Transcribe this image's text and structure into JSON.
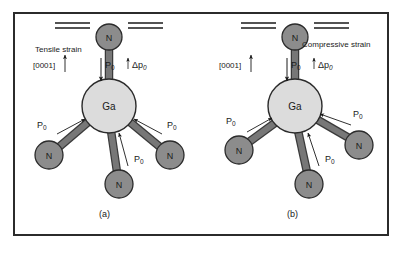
{
  "figure": {
    "panels": [
      {
        "id": "a",
        "caption": "(a)",
        "strain_label": "Tensile strain",
        "direction_label": "[0001]",
        "center_atom": "Ga",
        "ligand_atoms": [
          "N",
          "N",
          "N",
          "N"
        ],
        "axial_polarization_label": "P",
        "axial_polarization_sub": "0",
        "delta_label": "Δp",
        "delta_sub": "0",
        "bond_polarization_labels": [
          "P",
          "P",
          "P"
        ],
        "bond_polarization_sub": "0"
      },
      {
        "id": "b",
        "caption": "(b)",
        "strain_label": "Compressive strain",
        "direction_label": "[0001]",
        "center_atom": "Ga",
        "ligand_atoms": [
          "N",
          "N",
          "N",
          "N"
        ],
        "axial_polarization_label": "P",
        "axial_polarization_sub": "0",
        "delta_label": "Δp",
        "delta_sub": "0",
        "bond_polarization_labels": [
          "P",
          "P",
          "P"
        ],
        "bond_polarization_sub": "0"
      }
    ]
  },
  "colors": {
    "frame_border": "#2b2b2b",
    "background": "#ffffff",
    "ga_atom_fill": "#dcdcdc",
    "n_atom_fill": "#8c8c8c",
    "atom_outline": "#2b2b2b",
    "bond_fill": "#707070",
    "bond_outline": "#3a3a3a",
    "text": "#1a1a1a",
    "strain_line": "#1a1a1a"
  },
  "diagram_meta": {
    "type": "molecular-schematic",
    "subject": "GaN tetrahedral bonding under strain",
    "panel_count": 2
  }
}
